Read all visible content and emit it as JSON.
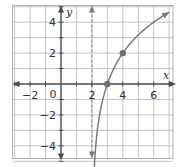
{
  "chart_data": {
    "type": "line",
    "title": "",
    "xlabel": "x",
    "ylabel": "y",
    "xlim": [
      -3.2,
      7.2
    ],
    "ylim": [
      -5.1,
      5.1
    ],
    "grid": true,
    "grid_step": 1,
    "x_ticks": [
      -2,
      0,
      2,
      4,
      6
    ],
    "y_ticks": [
      -4,
      -2,
      2,
      4
    ],
    "x_tick_labels": [
      "−2",
      "0",
      "2",
      "4",
      "6"
    ],
    "y_tick_labels": [
      "−4",
      "−2",
      "2",
      "4"
    ],
    "origin_label": "0",
    "series": [
      {
        "name": "f(x) = 2·log2(x − 2)",
        "function": "2*log2(x-2)",
        "domain": [
          2.09,
          7
        ],
        "arrows": "both",
        "color": "#7a7a7a"
      }
    ],
    "asymptote": {
      "type": "vertical",
      "x": 2,
      "style": "dashed",
      "arrows": "both"
    },
    "points": [
      {
        "x": 3,
        "y": 0
      },
      {
        "x": 4,
        "y": 2
      }
    ],
    "colors": {
      "grid": "#c4c4c4",
      "axis": "#4a4a4a",
      "curve": "#7a7a7a",
      "point": "#6e6e6e"
    }
  }
}
